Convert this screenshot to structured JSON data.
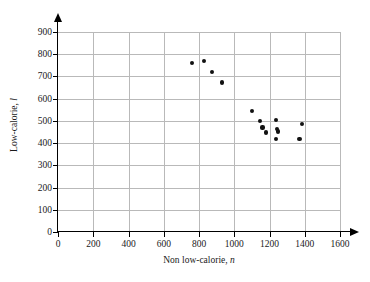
{
  "chart_data": {
    "type": "scatter",
    "title": "",
    "xlabel": "Non low-calorie, n",
    "xlabel_main": "Non low-calorie,",
    "xlabel_var": "n",
    "ylabel": "Low-calorie, l",
    "ylabel_main": "Low-calorie,",
    "ylabel_var": "l",
    "xlim": [
      0,
      1600
    ],
    "ylim": [
      0,
      900
    ],
    "xticks": [
      0,
      200,
      400,
      600,
      800,
      1000,
      1200,
      1400,
      1600
    ],
    "yticks": [
      0,
      100,
      200,
      300,
      400,
      500,
      600,
      700,
      800,
      900
    ],
    "xtick_labels": [
      "0",
      "200",
      "400",
      "600",
      "800",
      "1000",
      "1200",
      "1400",
      "1600"
    ],
    "ytick_labels": [
      "0",
      "100",
      "200",
      "300",
      "400",
      "500",
      "600",
      "700",
      "800",
      "900"
    ],
    "grid": true,
    "legend": null,
    "marker_color": "#111111",
    "grid_color": "#b9b9b9",
    "axis_color": "#000000",
    "points": [
      {
        "x": 760,
        "y": 760
      },
      {
        "x": 830,
        "y": 770
      },
      {
        "x": 872,
        "y": 720
      },
      {
        "x": 930,
        "y": 673
      },
      {
        "x": 1100,
        "y": 543
      },
      {
        "x": 1145,
        "y": 498
      },
      {
        "x": 1160,
        "y": 470
      },
      {
        "x": 1178,
        "y": 448
      },
      {
        "x": 1236,
        "y": 503
      },
      {
        "x": 1242,
        "y": 462
      },
      {
        "x": 1248,
        "y": 452
      },
      {
        "x": 1236,
        "y": 420
      },
      {
        "x": 1370,
        "y": 420
      },
      {
        "x": 1386,
        "y": 487
      }
    ]
  }
}
